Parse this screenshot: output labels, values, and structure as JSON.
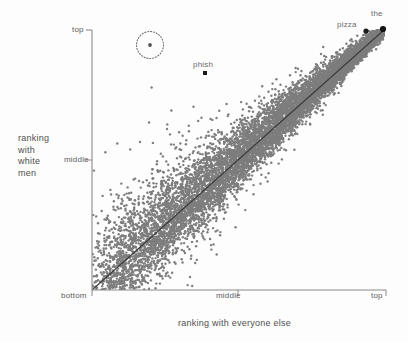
{
  "figure": {
    "background_color": "#fdfdfd",
    "point_color": "#7d7d7d",
    "axis_color": "#8a8a8a",
    "line_color": "#3b3b3b",
    "text_color": "#5c5c5c"
  },
  "axes": {
    "y": {
      "title_lines": [
        "ranking",
        "with",
        "white",
        "men"
      ],
      "ticks": [
        "top",
        "middle",
        "bottom"
      ]
    },
    "x": {
      "title": "ranking with everyone else",
      "ticks": [
        "bottom",
        "middle",
        "top"
      ]
    }
  },
  "annotations": {
    "phish": "phish",
    "pizza": "pizza",
    "the": "the"
  },
  "chart_data": {
    "type": "scatter",
    "title": "",
    "xlabel": "ranking with everyone else",
    "ylabel": "ranking with white men",
    "xticklabels": [
      "bottom",
      "middle",
      "top"
    ],
    "yticklabels": [
      "bottom",
      "middle",
      "top"
    ],
    "xtickvalues": [
      0,
      0.5,
      1
    ],
    "ytickvalues": [
      0,
      0.5,
      1
    ],
    "xlim": [
      0,
      1
    ],
    "ylim": [
      0,
      1
    ],
    "grid": false,
    "legend": null,
    "reference_line": {
      "description": "identity line y = x",
      "from": [
        0,
        0
      ],
      "to": [
        1,
        1
      ]
    },
    "highlighted_points": [
      {
        "label": "the",
        "x": 1.0,
        "y": 1.0
      },
      {
        "label": "pizza",
        "x": 0.975,
        "y": 0.982
      },
      {
        "label": "phish",
        "x": 0.385,
        "y": 0.835
      },
      {
        "label": "",
        "x": 0.2,
        "y": 0.945,
        "circled": true
      }
    ],
    "series": [
      {
        "name": "words",
        "approx_point_count": 9000,
        "marker_size_px": 2.4,
        "color": "#7d7d7d"
      }
    ]
  }
}
